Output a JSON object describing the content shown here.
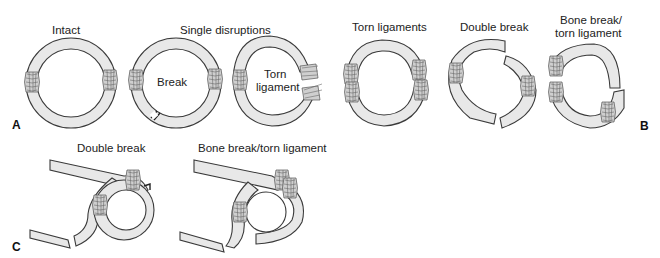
{
  "figure": {
    "panels": [
      {
        "id": "A",
        "label": "A",
        "items": [
          {
            "title": "Intact"
          },
          {
            "group_title": "Single disruptions"
          },
          {
            "inner_label": "Break"
          },
          {
            "inner_label": "Torn ligament",
            "line1": "Torn",
            "line2": "ligament"
          }
        ]
      },
      {
        "id": "B",
        "label": "B",
        "items": [
          {
            "title": "Torn ligaments"
          },
          {
            "title": "Double break"
          },
          {
            "title": "Bone break/ torn ligament",
            "line1": "Bone break/",
            "line2": "torn ligament"
          }
        ]
      },
      {
        "id": "C",
        "label": "C",
        "items": [
          {
            "title": "Double break"
          },
          {
            "title": "Bone break/torn ligament"
          }
        ]
      }
    ]
  },
  "colors": {
    "bone_fill": "#e8e8e8",
    "outline": "#3a3a3a",
    "ligament": "#cfcfcf",
    "background": "#ffffff"
  }
}
